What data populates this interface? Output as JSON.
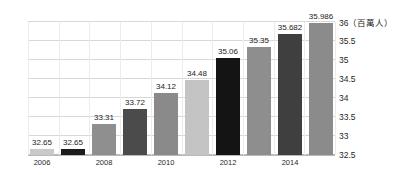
{
  "chart_data": {
    "type": "bar",
    "title": "",
    "subtitle": "",
    "xlabel": "",
    "ylabel": "",
    "unit_label": "（百萬人）",
    "categories": [
      "2006",
      "2007",
      "2008",
      "2009",
      "2010",
      "2011",
      "2012",
      "2013",
      "2014",
      "2015"
    ],
    "x_tick_labels": [
      "2006",
      "",
      "2008",
      "",
      "2010",
      "",
      "2012",
      "",
      "2014",
      ""
    ],
    "values": [
      32.65,
      32.65,
      33.31,
      33.72,
      34.12,
      34.48,
      35.06,
      35.35,
      35.682,
      35.986
    ],
    "data_labels": [
      "32.65",
      "32.65",
      "33.31",
      "33.72",
      "34.12",
      "34.48",
      "35.06",
      "35.35",
      "35.682",
      "35.986"
    ],
    "ylim": [
      32.5,
      36
    ],
    "y_ticks": [
      36,
      35.5,
      35,
      34.5,
      34,
      33.5,
      33,
      32.5
    ],
    "y_tick_labels": [
      "36",
      "35.5",
      "35",
      "34.5",
      "34",
      "33.5",
      "33",
      "32.5"
    ],
    "y_axis_position": "right",
    "grid": true,
    "grid_vertical": true,
    "legend": "none",
    "bar_colors": [
      "#c9c9c9",
      "#1b1b1b",
      "#8f8f8f",
      "#4b4b4b",
      "#8a8a8a",
      "#c4c4c4",
      "#141414",
      "#8e8e8e",
      "#3f3f3f",
      "#8b8b8b"
    ],
    "colors": {
      "background": "#ffffff",
      "gridline": "#d8d8d8",
      "gridline_vertical": "#ececec",
      "axis": "#b9b9b9",
      "label_text": "#1c1c1c"
    }
  }
}
